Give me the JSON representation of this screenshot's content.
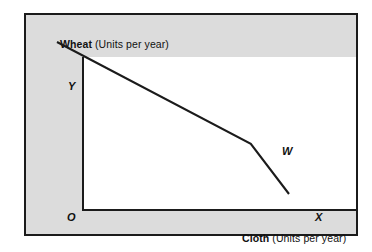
{
  "figure": {
    "background_color": "#dcdcdc",
    "plot_background_color": "#ffffff",
    "border_color": "#1b1b1b",
    "line_color": "#1b1b1b"
  },
  "axes": {
    "y_axis": {
      "title_bold": "Wheat",
      "title_regular": " (Units per year)"
    },
    "x_axis": {
      "title_bold": "Cloth",
      "title_regular": " (Units per year)"
    },
    "origin_label": "O"
  },
  "points": {
    "Y": {
      "label": "Y",
      "x": 0,
      "y": 100
    },
    "W": {
      "label": "W",
      "x": 71,
      "y": 33
    },
    "X": {
      "label": "X",
      "x": 85,
      "y": 0
    }
  },
  "chart_data": {
    "type": "line",
    "title": "",
    "subtitle": "",
    "xlabel": "Cloth (Units per year)",
    "ylabel": "Wheat (Units per year)",
    "grid": false,
    "legend": "none",
    "xlim": [
      0,
      100
    ],
    "ylim": [
      0,
      100
    ],
    "annotations": [
      "Y",
      "W",
      "X",
      "O"
    ],
    "series": [
      {
        "name": "Production possibility frontier",
        "x": [
          0,
          71,
          85
        ],
        "y": [
          100,
          33,
          0
        ],
        "point_labels": [
          "Y",
          "W",
          "X"
        ]
      }
    ]
  }
}
